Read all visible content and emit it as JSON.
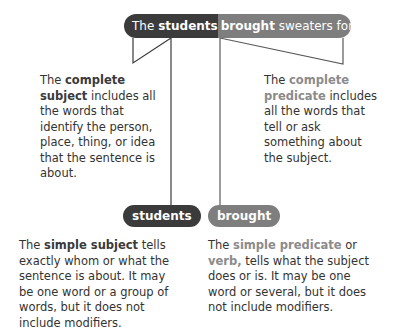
{
  "sentence": {
    "prefix": "The ",
    "subject": "students",
    "verb": "brought",
    "rest": " sweaters for the hike."
  },
  "complete_subject": {
    "lead": "The ",
    "term": "complete subject",
    "body": "includes all the words that identify the person, place, thing, or idea that the sentence is about."
  },
  "complete_predicate": {
    "lead": "The ",
    "term": "complete predicate",
    "body": "includes all the words that tell or ask something about the subject."
  },
  "simple_subject": {
    "pill": "students",
    "lead": "The ",
    "term": "simple subject",
    "body": " tells exactly whom or what the sentence is about. It may be one word or a group of words, but it does not include modifiers."
  },
  "simple_predicate": {
    "pill": "brought",
    "lead": "The ",
    "term": "simple predicate",
    "mid": " or ",
    "term2": "verb,",
    "body": " tells what the subject does or is. It may be one word or several, but it does not include modifiers."
  },
  "colors": {
    "dark": "#3b3b3b",
    "gray": "#7e7e7e",
    "highlight_gray": "#8b8b8b"
  }
}
